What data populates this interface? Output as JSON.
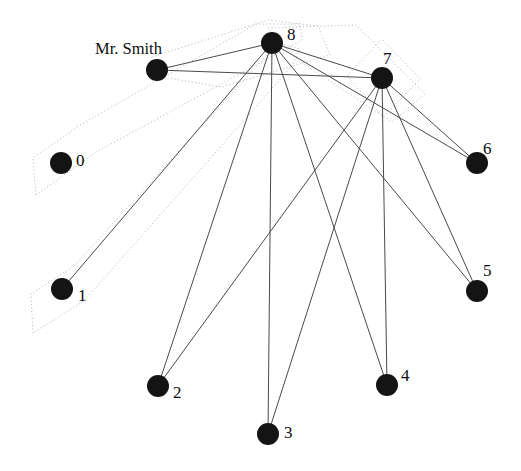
{
  "graph": {
    "title_label": "Mr. Smith",
    "background_color": "#ffffff",
    "node_color": "#141414",
    "edge_color": "#4a4a4a",
    "hull_color": "#b9b9b9",
    "node_radius": 11,
    "nodes": [
      {
        "id": "smith",
        "label": "Mr. Smith",
        "label_kind": "name",
        "x": 157,
        "y": 70,
        "label_x": 95,
        "label_y": 50
      },
      {
        "id": "n0",
        "label": "0",
        "label_kind": "number",
        "x": 61,
        "y": 163,
        "label_x": 76,
        "label_y": 162
      },
      {
        "id": "n1",
        "label": "1",
        "label_kind": "number",
        "x": 62,
        "y": 289,
        "label_x": 78,
        "label_y": 297
      },
      {
        "id": "n2",
        "label": "2",
        "label_kind": "number",
        "x": 158,
        "y": 386,
        "label_x": 173,
        "label_y": 394
      },
      {
        "id": "n3",
        "label": "3",
        "label_kind": "number",
        "x": 268,
        "y": 434,
        "label_x": 284,
        "label_y": 434
      },
      {
        "id": "n4",
        "label": "4",
        "label_kind": "number",
        "x": 387,
        "y": 385,
        "label_x": 401,
        "label_y": 377
      },
      {
        "id": "n5",
        "label": "5",
        "label_kind": "number",
        "x": 477,
        "y": 291,
        "label_x": 483,
        "label_y": 272
      },
      {
        "id": "n6",
        "label": "6",
        "label_kind": "number",
        "x": 477,
        "y": 163,
        "label_x": 483,
        "label_y": 150
      },
      {
        "id": "n7",
        "label": "7",
        "label_kind": "number",
        "x": 382,
        "y": 78,
        "label_x": 383,
        "label_y": 60
      },
      {
        "id": "n8",
        "label": "8",
        "label_kind": "number",
        "x": 272,
        "y": 43,
        "label_x": 287,
        "label_y": 36
      }
    ],
    "edges": [
      {
        "from": "smith",
        "to": "n8"
      },
      {
        "from": "smith",
        "to": "n7"
      },
      {
        "from": "n8",
        "to": "n7"
      },
      {
        "from": "n8",
        "to": "n1"
      },
      {
        "from": "n8",
        "to": "n2"
      },
      {
        "from": "n8",
        "to": "n3"
      },
      {
        "from": "n8",
        "to": "n4"
      },
      {
        "from": "n8",
        "to": "n5"
      },
      {
        "from": "n8",
        "to": "n6"
      },
      {
        "from": "n7",
        "to": "n2"
      },
      {
        "from": "n7",
        "to": "n3"
      },
      {
        "from": "n7",
        "to": "n4"
      },
      {
        "from": "n7",
        "to": "n5"
      },
      {
        "from": "n7",
        "to": "n6"
      }
    ],
    "hulls": [
      {
        "id": "hull-0",
        "points": "36,195 33,158 77,127 256,24 300,24 302,40 96,152"
      },
      {
        "id": "hull-1",
        "points": "33,333 31,294 74,266 278,43 300,49 292,66 84,301"
      },
      {
        "id": "hull-2",
        "points": "149,75 152,57 268,20 318,26 330,55 222,87"
      },
      {
        "id": "hull-3",
        "points": "347,76 382,39 420,79 383,117"
      },
      {
        "id": "hull-4",
        "points": "268,28 356,25 425,94 392,122 295,58"
      }
    ]
  }
}
